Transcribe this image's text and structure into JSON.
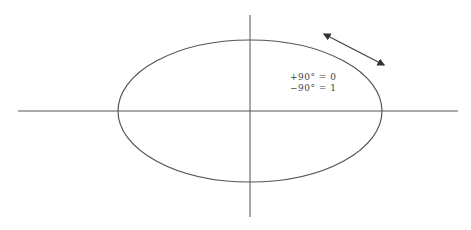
{
  "diagram": {
    "type": "polarization-ellipse",
    "axes": {
      "horizontal": {
        "x1": 18,
        "y1": 111,
        "x2": 458,
        "y2": 111
      },
      "vertical": {
        "x1": 250,
        "y1": 15,
        "x2": 250,
        "y2": 217
      }
    },
    "ellipse": {
      "cx": 250,
      "cy": 111,
      "rx": 132,
      "ry": 71
    },
    "arrow": {
      "x1": 324,
      "y1": 34,
      "x2": 384,
      "y2": 65,
      "double_headed": true
    },
    "labels": [
      {
        "text": "+90° = 0",
        "x": 290,
        "y": 72
      },
      {
        "text": "−90° = 1",
        "x": 290,
        "y": 83
      }
    ],
    "colors": {
      "stroke": "#555555",
      "text": "#444444",
      "background": "#ffffff"
    }
  }
}
